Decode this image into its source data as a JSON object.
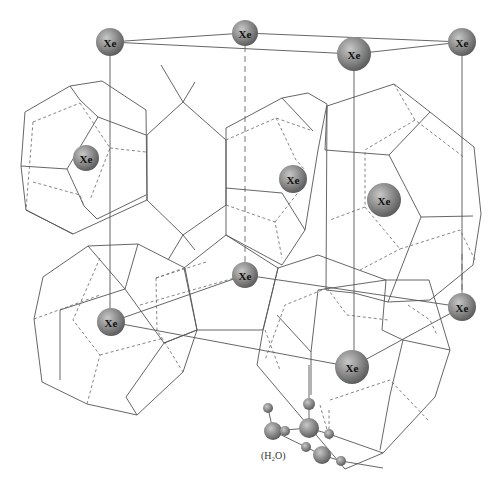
{
  "diagram": {
    "atom_label": "Xe",
    "water_label": "(H₂O)",
    "colors": {
      "background": "#ffffff",
      "edge": "#555555",
      "sphere_light": "#c8c8c8",
      "sphere_dark": "#6a6a6a",
      "label": "#111111"
    },
    "xe_atoms": [
      {
        "id": "xe-top-left",
        "x": 110,
        "y": 42,
        "r": 14
      },
      {
        "id": "xe-top-mid",
        "x": 245,
        "y": 33,
        "r": 13
      },
      {
        "id": "xe-top-center-front",
        "x": 354,
        "y": 54,
        "r": 17
      },
      {
        "id": "xe-top-right",
        "x": 462,
        "y": 42,
        "r": 14
      },
      {
        "id": "xe-left-cage",
        "x": 86,
        "y": 158,
        "r": 13
      },
      {
        "id": "xe-center-cage",
        "x": 293,
        "y": 179,
        "r": 14
      },
      {
        "id": "xe-right-cage",
        "x": 384,
        "y": 200,
        "r": 17
      },
      {
        "id": "xe-lower-mid",
        "x": 245,
        "y": 275,
        "r": 13
      },
      {
        "id": "xe-lower-left",
        "x": 111,
        "y": 322,
        "r": 14
      },
      {
        "id": "xe-lower-right",
        "x": 462,
        "y": 307,
        "r": 14
      },
      {
        "id": "xe-bottom-center",
        "x": 352,
        "y": 367,
        "r": 17
      }
    ],
    "water_molecule_spheres": [
      {
        "x": 268,
        "y": 408,
        "r": 5
      },
      {
        "x": 309,
        "y": 404,
        "r": 6
      },
      {
        "x": 273,
        "y": 431,
        "r": 9
      },
      {
        "x": 285,
        "y": 431,
        "r": 5
      },
      {
        "x": 309,
        "y": 428,
        "r": 10
      },
      {
        "x": 329,
        "y": 434,
        "r": 5
      },
      {
        "x": 306,
        "y": 447,
        "r": 5
      },
      {
        "x": 322,
        "y": 455,
        "r": 9
      },
      {
        "x": 341,
        "y": 461,
        "r": 5
      }
    ]
  }
}
